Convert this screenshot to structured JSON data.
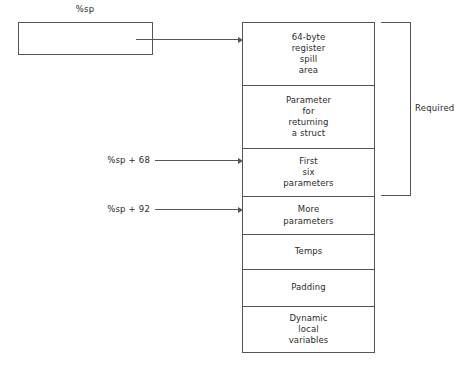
{
  "diagram": {
    "caller_box": {
      "label": "%sp",
      "pointer_target": "64-byte register spill area"
    },
    "stack_cells": [
      {
        "text": "64-byte\nregister\nspill\narea",
        "height": 63
      },
      {
        "text": "Parameter\nfor\nreturning\na struct",
        "height": 63
      },
      {
        "text": "First\nsix\nparameters",
        "height": 48
      },
      {
        "text": "More\nparameters",
        "height": 38
      },
      {
        "text": "Temps",
        "height": 35
      },
      {
        "text": "Padding",
        "height": 37
      },
      {
        "text": "Dynamic\nlocal\nvariables",
        "height": 47
      }
    ],
    "offset_pointers": [
      {
        "label": "%sp + 68",
        "target_cell": "First six parameters",
        "top": 155,
        "label_left": 70,
        "shaft_left": 155,
        "shaft_width": 82
      },
      {
        "label": "%sp + 92",
        "target_cell": "More parameters",
        "top": 204,
        "label_left": 70,
        "shaft_left": 155,
        "shaft_width": 82
      }
    ],
    "bracket": {
      "label": "Required",
      "covers": [
        "64-byte register spill area",
        "Parameter for returning a struct",
        "First six parameters"
      ]
    },
    "colors": {
      "stroke": "#555555",
      "text": "#2b2b2b",
      "background": "#ffffff"
    }
  }
}
